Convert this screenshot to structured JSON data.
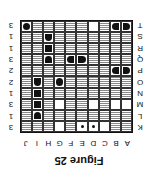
{
  "figure": {
    "caption": "Figure 25",
    "rotation_degrees": 180
  },
  "columns": {
    "labels": [
      "A",
      "B",
      "C",
      "D",
      "E",
      "F",
      "G",
      "H",
      "I",
      "J"
    ],
    "counts": [
      "2",
      "2",
      "0",
      "2",
      "2",
      "2",
      "2",
      "3",
      "4",
      "1"
    ]
  },
  "rows": {
    "labels": [
      "K",
      "L",
      "M",
      "N",
      "O",
      "P",
      "Q",
      "R",
      "S",
      "T"
    ],
    "counts": [
      "3",
      "1",
      "3",
      "1",
      "2",
      "2",
      "3",
      "1",
      "1",
      "3"
    ]
  },
  "grid": {
    "legend": {
      "water": "wavy-water",
      "white": "unknown-empty",
      "dot": "hint-dot",
      "ship": "ship-segment"
    },
    "cells": [
      [
        "water",
        "water",
        "white",
        "dot",
        "dot",
        "water",
        "white",
        "water",
        "water",
        "water"
      ],
      [
        "water",
        "water",
        "water",
        "water",
        "water",
        "water",
        "water",
        "water",
        "ship-bottom",
        "water"
      ],
      [
        "white",
        "white",
        "water",
        "white",
        "water",
        "water",
        "white",
        "water",
        "ship-mid",
        "water"
      ],
      [
        "water",
        "water",
        "water",
        "water",
        "water",
        "water",
        "water",
        "water",
        "ship-mid",
        "water"
      ],
      [
        "water",
        "water",
        "water",
        "water",
        "water",
        "water",
        "circle",
        "water",
        "ship-top",
        "water"
      ],
      [
        "ship-left",
        "ship-right",
        "water",
        "water",
        "water",
        "water",
        "water",
        "water",
        "water",
        "water"
      ],
      [
        "water",
        "water",
        "water",
        "water",
        "ship-left",
        "ship-right",
        "water",
        "ship-bottom",
        "water",
        "water"
      ],
      [
        "water",
        "water",
        "water",
        "water",
        "water",
        "water",
        "water",
        "ship-mid",
        "water",
        "water"
      ],
      [
        "water",
        "water",
        "water",
        "water",
        "water",
        "water",
        "water",
        "ship-top",
        "water",
        "water"
      ],
      [
        "ship-left",
        "ship-right",
        "water",
        "white",
        "water",
        "water",
        "water",
        "water",
        "water",
        "circle"
      ]
    ]
  }
}
